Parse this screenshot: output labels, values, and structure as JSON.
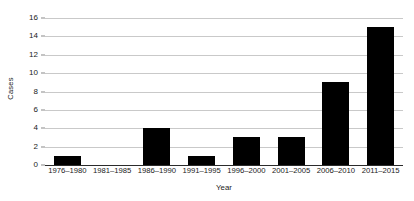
{
  "chart_data": {
    "type": "bar",
    "title": "",
    "subtitle": "",
    "xlabel": "Year",
    "ylabel": "Cases",
    "categories": [
      "1976–1980",
      "1981–1985",
      "1986–1990",
      "1991–1995",
      "1996–2000",
      "2001–2005",
      "2006–2010",
      "2011–2015"
    ],
    "values": [
      1,
      0,
      4,
      1,
      3,
      3,
      9,
      15
    ],
    "ylim": [
      0,
      16
    ],
    "ytick_values": [
      0,
      2,
      4,
      6,
      8,
      10,
      12,
      14,
      16
    ],
    "ytick_labels": [
      "0",
      "2",
      "4",
      "6",
      "8",
      "10",
      "12",
      "14",
      "16"
    ],
    "ytick_step": 2,
    "grid": true,
    "grid_axis": "y",
    "legend": false,
    "legend_position": "none",
    "bar_color": "#000000",
    "gridline_color": "#c9c9c9",
    "axis_color": "#2b2b2b",
    "background_color": "#ffffff"
  }
}
